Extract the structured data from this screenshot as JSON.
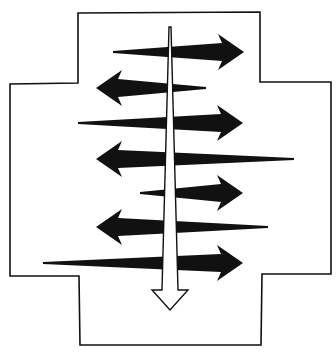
{
  "diagram": {
    "colors": {
      "background": "#ffffff",
      "ink": "#111111",
      "vertical_arrow_fill": "#ffffff"
    },
    "container": {
      "shape": "cross",
      "outline": "ink"
    },
    "horizontal_arrows": [
      {
        "id": "h1",
        "direction": "right"
      },
      {
        "id": "h2",
        "direction": "left"
      },
      {
        "id": "h3",
        "direction": "right"
      },
      {
        "id": "h4",
        "direction": "left"
      },
      {
        "id": "h5",
        "direction": "right"
      },
      {
        "id": "h6",
        "direction": "left"
      },
      {
        "id": "h7",
        "direction": "right"
      }
    ],
    "vertical_arrow": {
      "direction": "down",
      "style": "hollow"
    }
  }
}
